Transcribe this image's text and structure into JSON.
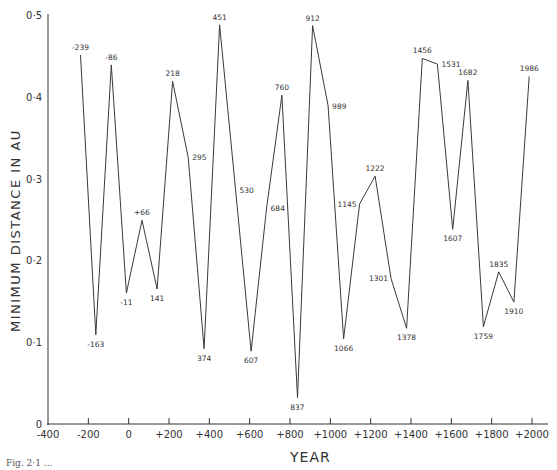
{
  "chart_data": {
    "type": "line",
    "title": "",
    "xlabel": "YEAR",
    "ylabel": "MINIMUM DISTANCE IN AU",
    "xlim": [
      -400,
      2000
    ],
    "ylim": [
      0,
      0.5
    ],
    "x_ticks": [
      "-400",
      "-200",
      "0",
      "+200",
      "+400",
      "+600",
      "+800",
      "+1000",
      "+1200",
      "+1400",
      "+1600",
      "+1800",
      "+2000"
    ],
    "x_tick_values": [
      -400,
      -200,
      0,
      200,
      400,
      600,
      800,
      1000,
      1200,
      1400,
      1600,
      1800,
      2000
    ],
    "y_ticks": [
      "0",
      "0·1",
      "0·2",
      "0·3",
      "0·4",
      "0·5"
    ],
    "y_tick_values": [
      0,
      0.1,
      0.2,
      0.3,
      0.4,
      0.5
    ],
    "grid": false,
    "legend": null,
    "series": [
      {
        "name": "Halley's Comet closest approach to Earth",
        "points": [
          {
            "label": "-239",
            "x": -239,
            "y": 0.451,
            "label_pos": "above"
          },
          {
            "label": "-163",
            "x": -163,
            "y": 0.109,
            "label_pos": "below"
          },
          {
            "label": "-86",
            "x": -86,
            "y": 0.439,
            "label_pos": "above"
          },
          {
            "label": "-11",
            "x": -11,
            "y": 0.16,
            "label_pos": "below"
          },
          {
            "label": "+66",
            "x": 66,
            "y": 0.249,
            "label_pos": "above"
          },
          {
            "label": "141",
            "x": 141,
            "y": 0.165,
            "label_pos": "below"
          },
          {
            "label": "218",
            "x": 218,
            "y": 0.419,
            "label_pos": "above"
          },
          {
            "label": "295",
            "x": 295,
            "y": 0.326,
            "label_pos": "right"
          },
          {
            "label": "374",
            "x": 374,
            "y": 0.092,
            "label_pos": "below"
          },
          {
            "label": "451",
            "x": 451,
            "y": 0.488,
            "label_pos": "above"
          },
          {
            "label": "530",
            "x": 530,
            "y": 0.286,
            "label_pos": "right"
          },
          {
            "label": "607",
            "x": 607,
            "y": 0.089,
            "label_pos": "below"
          },
          {
            "label": "684",
            "x": 684,
            "y": 0.264,
            "label_pos": "right"
          },
          {
            "label": "760",
            "x": 760,
            "y": 0.402,
            "label_pos": "above"
          },
          {
            "label": "837",
            "x": 837,
            "y": 0.032,
            "label_pos": "below"
          },
          {
            "label": "912",
            "x": 912,
            "y": 0.487,
            "label_pos": "above"
          },
          {
            "label": "989",
            "x": 989,
            "y": 0.389,
            "label_pos": "right"
          },
          {
            "label": "1066",
            "x": 1066,
            "y": 0.104,
            "label_pos": "below"
          },
          {
            "label": "1145",
            "x": 1145,
            "y": 0.269,
            "label_pos": "left"
          },
          {
            "label": "1222",
            "x": 1222,
            "y": 0.303,
            "label_pos": "above"
          },
          {
            "label": "1301",
            "x": 1301,
            "y": 0.178,
            "label_pos": "left"
          },
          {
            "label": "1378",
            "x": 1378,
            "y": 0.117,
            "label_pos": "below"
          },
          {
            "label": "1456",
            "x": 1456,
            "y": 0.447,
            "label_pos": "above"
          },
          {
            "label": "1531",
            "x": 1531,
            "y": 0.44,
            "label_pos": "right"
          },
          {
            "label": "1607",
            "x": 1607,
            "y": 0.238,
            "label_pos": "below"
          },
          {
            "label": "1682",
            "x": 1682,
            "y": 0.42,
            "label_pos": "above"
          },
          {
            "label": "1759",
            "x": 1759,
            "y": 0.119,
            "label_pos": "below"
          },
          {
            "label": "1835",
            "x": 1835,
            "y": 0.186,
            "label_pos": "above"
          },
          {
            "label": "1910",
            "x": 1910,
            "y": 0.149,
            "label_pos": "below"
          },
          {
            "label": "1986",
            "x": 1986,
            "y": 0.425,
            "label_pos": "above"
          }
        ]
      }
    ]
  },
  "caption": "Fig. 2·1 ..."
}
